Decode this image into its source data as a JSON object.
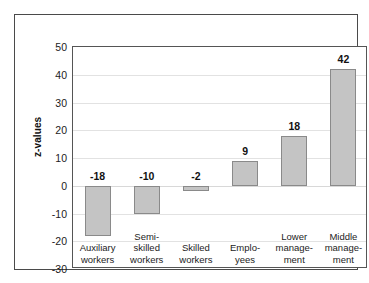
{
  "chart_data": {
    "type": "bar",
    "title": "",
    "xlabel": "",
    "ylabel": "z-values",
    "ylim": [
      -30,
      50
    ],
    "yticks": [
      50,
      40,
      30,
      20,
      10,
      0,
      -10,
      -20,
      -30
    ],
    "ytick_labels": [
      "50",
      "40",
      "30",
      "20",
      "10",
      "0",
      "-10",
      "-20",
      "-30"
    ],
    "grid": true,
    "legend": "none",
    "categories": [
      "Auxiliary workers",
      "Semi-skilled workers",
      "Skilled workers",
      "Emplo-yees",
      "Lower manage-ment",
      "Middle manage-ment"
    ],
    "category_lines": [
      [
        "Auxiliary",
        "workers"
      ],
      [
        "Semi-",
        "skilled",
        "workers"
      ],
      [
        "Skilled",
        "workers"
      ],
      [
        "Emplo-",
        "yees"
      ],
      [
        "Lower",
        "manage-",
        "ment"
      ],
      [
        "Middle",
        "manage-",
        "ment"
      ]
    ],
    "values": [
      -18,
      -10,
      -2,
      9,
      18,
      42
    ],
    "value_labels": [
      "-18",
      "-10",
      "-2",
      "9",
      "18",
      "42"
    ],
    "bar_fill": "#c4c4c4",
    "bar_edge": "#8a8a8a",
    "gridline_color": "#e2e2e2",
    "axis_color": "#555555",
    "frame_color": "#4a4a4a"
  }
}
